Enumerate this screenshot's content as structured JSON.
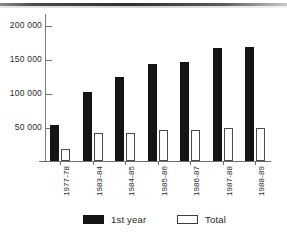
{
  "chart_data": {
    "type": "bar",
    "title": "",
    "subtitle": "",
    "xlabel": "",
    "ylabel": "",
    "grid": false,
    "legend_position": "bottom",
    "ylim": [
      0,
      220000
    ],
    "yticks": [
      50000,
      100000,
      150000,
      200000
    ],
    "ytick_labels": [
      "50 000",
      "100 000",
      "150 000",
      "200 000"
    ],
    "categories": [
      "1977-78",
      "1983-84",
      "1984-85",
      "1985-86",
      "1986-87",
      "1987-88",
      "1988-89"
    ],
    "series": [
      {
        "name": "1st year",
        "color": "#141414",
        "values": [
          53000,
          102000,
          124000,
          143000,
          146000,
          166000,
          167000
        ]
      },
      {
        "name": "Total",
        "color": "#ffffff",
        "values": [
          18000,
          41000,
          41000,
          46000,
          46000,
          49000,
          48000
        ]
      }
    ]
  },
  "legend": {
    "items": [
      {
        "label": "1st year",
        "swatch": "filled-black-swatch"
      },
      {
        "label": "Total",
        "swatch": "outlined-white-swatch"
      }
    ]
  },
  "axis": {
    "y_tick_labels": [
      "200 000",
      "150 000",
      "100 000",
      "50 000"
    ],
    "x_tick_labels": [
      "1977-78",
      "1983-84",
      "1984-85",
      "1985-86",
      "1986-87",
      "1987-88",
      "1988-89"
    ]
  }
}
